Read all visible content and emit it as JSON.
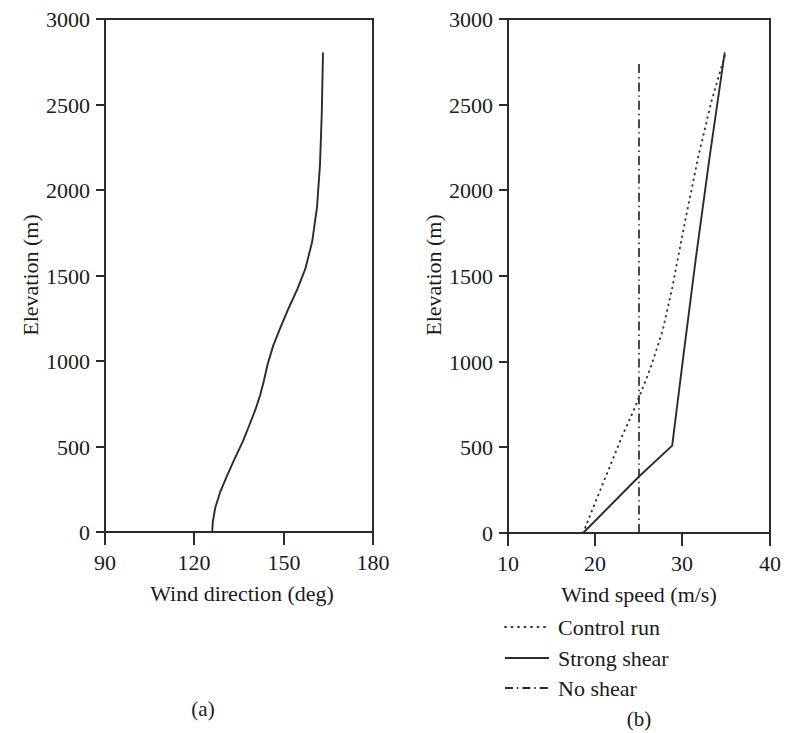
{
  "figure": {
    "panels": [
      {
        "tag": "(a)",
        "xlabel": "Wind direction (deg)",
        "ylabel": "Elevation (m)",
        "xticks": [
          "90",
          "120",
          "150",
          "180"
        ],
        "yticks": [
          "0",
          "500",
          "1000",
          "1500",
          "2000",
          "2500",
          "3000"
        ]
      },
      {
        "tag": "(b)",
        "xlabel": "Wind speed (m/s)",
        "ylabel": "Elevation (m)",
        "xticks": [
          "10",
          "20",
          "30",
          "40"
        ],
        "yticks": [
          "0",
          "500",
          "1000",
          "1500",
          "2000",
          "2500",
          "3000"
        ]
      }
    ],
    "legend": [
      {
        "label": "Control run",
        "style": "dotted"
      },
      {
        "label": "Strong shear",
        "style": "solid"
      },
      {
        "label": "No shear",
        "style": "dashdot"
      }
    ],
    "colors": {
      "ink": "#2b2b2b",
      "background": "#ffffff"
    }
  },
  "chart_data": [
    {
      "type": "line",
      "panel": "(a)",
      "title": "",
      "xlabel": "Wind direction (deg)",
      "ylabel": "Elevation (m)",
      "xlim": [
        90,
        180
      ],
      "ylim": [
        0,
        3000
      ],
      "xticks": [
        90,
        120,
        150,
        180
      ],
      "yticks": [
        0,
        500,
        1000,
        1500,
        2000,
        2500,
        3000
      ],
      "grid": false,
      "legend_position": "none",
      "series": [
        {
          "name": "Wind direction profile",
          "style": "solid",
          "x": [
            126.0,
            126.2,
            127.0,
            128.6,
            131.0,
            133.6,
            136.3,
            138.6,
            140.6,
            142.1,
            143.3,
            144.6,
            146.5,
            149.0,
            151.7,
            154.6,
            157.3,
            159.6,
            161.2,
            162.2,
            162.8,
            163.2
          ],
          "y": [
            0,
            60,
            140,
            230,
            330,
            430,
            530,
            630,
            720,
            800,
            880,
            980,
            1090,
            1200,
            1310,
            1420,
            1540,
            1700,
            1900,
            2150,
            2450,
            2800
          ]
        }
      ]
    },
    {
      "type": "line",
      "panel": "(b)",
      "title": "",
      "xlabel": "Wind speed (m/s)",
      "ylabel": "Elevation (m)",
      "xlim": [
        10,
        40
      ],
      "ylim": [
        0,
        3000
      ],
      "xticks": [
        10,
        20,
        30,
        40
      ],
      "yticks": [
        0,
        500,
        1000,
        1500,
        2000,
        2500,
        3000
      ],
      "grid": false,
      "legend_position": "below",
      "series": [
        {
          "name": "Control run",
          "style": "dotted",
          "x": [
            18.6,
            20.0,
            21.6,
            23.1,
            24.6,
            26.3,
            27.7,
            28.8,
            30.2,
            31.8,
            33.3,
            34.9
          ],
          "y": [
            0,
            180,
            380,
            570,
            740,
            960,
            1180,
            1430,
            1800,
            2200,
            2520,
            2800
          ]
        },
        {
          "name": "Strong shear",
          "style": "solid",
          "x": [
            18.6,
            25.0,
            28.8,
            30.0,
            31.5,
            33.1,
            34.8
          ],
          "y": [
            0,
            330,
            510,
            1000,
            1600,
            2200,
            2800
          ]
        },
        {
          "name": "No shear",
          "style": "dashdot",
          "x": [
            25.0,
            25.0
          ],
          "y": [
            0,
            2750
          ]
        }
      ]
    }
  ]
}
